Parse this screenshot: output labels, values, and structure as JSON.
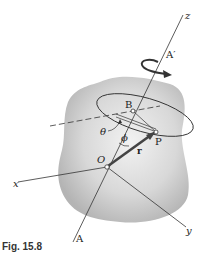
{
  "figure": {
    "caption": "Fig. 15.8",
    "labels": {
      "z_axis": "z",
      "x_axis": "x",
      "y_axis": "y",
      "origin": "O",
      "point_b": "B",
      "point_p": "P",
      "axis_top": "A′",
      "axis_bottom": "A",
      "angle_theta": "θ",
      "angle_phi": "ϕ",
      "position_vector": "r"
    },
    "colors": {
      "body_fill": "#c8c8c8",
      "line": "#333333",
      "vector": "#444444"
    }
  }
}
